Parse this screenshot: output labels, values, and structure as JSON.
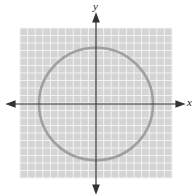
{
  "chart_data": {
    "type": "line",
    "title": "",
    "xlabel": "x",
    "ylabel": "y",
    "xlim": [
      -10,
      10
    ],
    "ylim": [
      -10,
      10
    ],
    "grid": true,
    "grid_cells": 20,
    "series": [
      {
        "name": "circle",
        "shape": "circle",
        "center": [
          0,
          0
        ],
        "radius": 7.5,
        "equation": "x^2 + y^2 = 56.25",
        "color": "#a0a0a0"
      }
    ],
    "colors": {
      "grid_background": "#d4d4d4",
      "grid_lines": "#f2f2f2",
      "axes": "#333333",
      "curve": "#a0a0a0"
    }
  }
}
